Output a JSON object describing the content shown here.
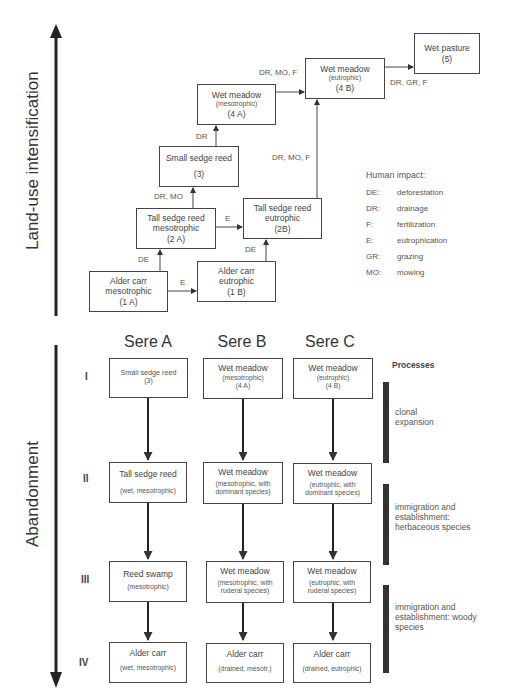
{
  "axes": {
    "upper_label": "Land-use intensification",
    "lower_label": "Abandonment"
  },
  "upper": {
    "boxes": {
      "b1a": {
        "title": "Alder carr",
        "line2": "mesotrophic",
        "code": "(1 A)"
      },
      "b1b": {
        "title": "Alder carr",
        "line2": "eutrophic",
        "code": "(1 B)"
      },
      "b2a": {
        "title": "Tall sedge reed",
        "line2": "mesotrophic",
        "code": "(2 A)"
      },
      "b2b": {
        "title": "Tall sedge reed",
        "line2": "eutrophic",
        "code": "(2B)"
      },
      "b3": {
        "title": "Small sedge reed",
        "code": "(3)"
      },
      "b4a": {
        "title": "Wet meadow",
        "line2": "(mesotrophic)",
        "code": "(4 A)"
      },
      "b4b": {
        "title": "Wet meadow",
        "line2": "(eutrophic)",
        "code": "(4 B)"
      },
      "b5": {
        "title": "Wet pasture",
        "code": "(5)"
      }
    },
    "transitions": {
      "t1a_2a": "DE",
      "t1a_1b": "E",
      "t1b_2b": "DE",
      "t2a_3": "DR, MO",
      "t2a_2b": "E",
      "t3_4a": "DR",
      "t4a_4b": "DR, MO, F",
      "t2b_4b": "DR, MO, F",
      "t4b_5": "DR, GR, F"
    },
    "legend": {
      "title": "Human impact:",
      "items": [
        {
          "code": "DE:",
          "meaning": "deforestation"
        },
        {
          "code": "DR:",
          "meaning": "drainage"
        },
        {
          "code": "F:",
          "meaning": "fertilization"
        },
        {
          "code": "E:",
          "meaning": "eutrophication"
        },
        {
          "code": "GR:",
          "meaning": "grazing"
        },
        {
          "code": "MO:",
          "meaning": "mowing"
        }
      ]
    }
  },
  "lower": {
    "seres": [
      "Sere A",
      "Sere B",
      "Sere C"
    ],
    "stages": [
      "I",
      "II",
      "III",
      "IV"
    ],
    "processes_title": "Processes",
    "processes": [
      "clonal expansion",
      "immigration and establishment: herbaceous species",
      "immigration and establishment: woody species"
    ],
    "processes_lines": [
      [
        "clonal",
        "expansion"
      ],
      [
        "immigration and",
        "establishment:",
        "herbaceous species"
      ],
      [
        "immigration and",
        "establishment: woody",
        "species"
      ]
    ],
    "cells": [
      [
        {
          "title": "Small sedge reed",
          "sub1": "(3)",
          "sub2": ""
        },
        {
          "title": "Wet meadow",
          "sub1": "(mesotrophic)",
          "sub2": "(4 A)"
        },
        {
          "title": "Wet meadow",
          "sub1": "(eutrophic)",
          "sub2": "(4 B)"
        }
      ],
      [
        {
          "title": "Tall sedge reed",
          "sub1": "(wet, mesotrophic)",
          "sub2": ""
        },
        {
          "title": "Wet meadow",
          "sub1": "(mesotrophic, with",
          "sub2": "dominant species)"
        },
        {
          "title": "Wet meadow",
          "sub1": "(eutrophic, with",
          "sub2": "dominant species)"
        }
      ],
      [
        {
          "title": "Reed swamp",
          "sub1": "(mesotrophic)",
          "sub2": ""
        },
        {
          "title": "Wet meadow",
          "sub1": "(mesotrophic, with",
          "sub2": "ruderal species)"
        },
        {
          "title": "Wet meadow",
          "sub1": "(eutrophic, with",
          "sub2": "ruderal species)"
        }
      ],
      [
        {
          "title": "Alder carr",
          "sub1": "(wet, mesotrophic)",
          "sub2": ""
        },
        {
          "title": "Alder carr",
          "sub1": "(drained, mesotr.)",
          "sub2": ""
        },
        {
          "title": "Alder carr",
          "sub1": "(drained, eutrophic)",
          "sub2": ""
        }
      ]
    ]
  }
}
